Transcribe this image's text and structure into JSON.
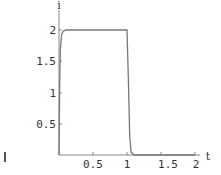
{
  "chart_data": {
    "type": "line",
    "title": "",
    "xlabel": "t",
    "ylabel": "i",
    "xlim": [
      0,
      2
    ],
    "ylim": [
      0,
      2
    ],
    "x_ticks": [
      "0.5",
      "1",
      "1.5",
      "2"
    ],
    "y_ticks": [
      "0.5",
      "1",
      "1.5",
      "2"
    ],
    "grid": false,
    "legend": null,
    "series": [
      {
        "name": "i(t)",
        "x": [
          0,
          0.01,
          0.02,
          0.04,
          0.06,
          0.1,
          0.5,
          1.0,
          1.02,
          1.04,
          1.06,
          1.1,
          1.5,
          2.0
        ],
        "y": [
          0,
          1.2,
          1.7,
          1.93,
          1.98,
          2.0,
          2.0,
          2.0,
          1.2,
          0.3,
          0.05,
          0,
          0,
          0
        ]
      }
    ]
  }
}
